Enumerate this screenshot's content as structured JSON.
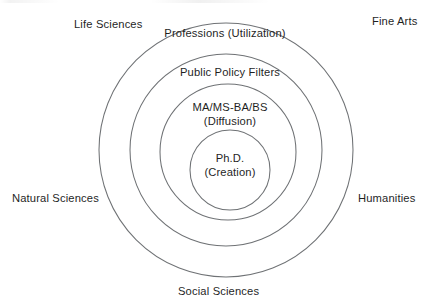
{
  "diagram": {
    "type": "concentric-circles",
    "center": {
      "x": 226,
      "y": 150
    },
    "background_color": "#ffffff",
    "stroke_color": "#6f7275",
    "text_color": "#1f1f1f",
    "rings": [
      {
        "level": 1,
        "radius": 127,
        "label": "Professions (Utilization)",
        "label_line1": "Professions (Utilization)",
        "label_line2": ""
      },
      {
        "level": 2,
        "radius": 96,
        "label": "Public Policy Filters",
        "label_line1": "Public Policy Filters",
        "label_line2": ""
      },
      {
        "level": 3,
        "radius": 68,
        "label": "MA/MS-BA/BS (Diffusion)",
        "label_line1": "MA/MS-BA/BS",
        "label_line2": "(Diffusion)"
      },
      {
        "level": 4,
        "radius": 40,
        "label": "Ph.D. (Creation)",
        "label_line1": "Ph.D.",
        "label_line2": "(Creation)"
      }
    ],
    "outer_labels": [
      {
        "id": "life-sciences",
        "text": "Life Sciences",
        "position": "top-left"
      },
      {
        "id": "fine-arts",
        "text": "Fine Arts",
        "position": "top-right"
      },
      {
        "id": "natural-sciences",
        "text": "Natural Sciences",
        "position": "left"
      },
      {
        "id": "humanities",
        "text": "Humanities",
        "position": "right"
      },
      {
        "id": "social-sciences",
        "text": "Social Sciences",
        "position": "bottom"
      }
    ]
  }
}
